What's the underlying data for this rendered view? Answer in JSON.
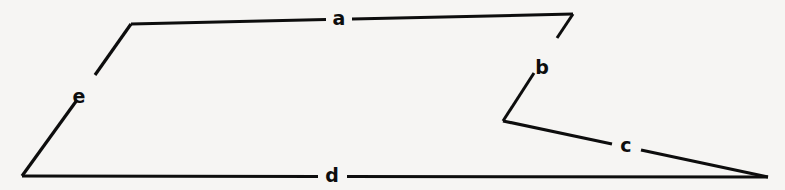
{
  "figure": {
    "kind": "labelled-polygon-line-drawing",
    "background_color": "#f6f5f3",
    "stroke_color": "#0d0d0d",
    "canvas": {
      "width": 785,
      "height": 190
    },
    "vertices": [
      {
        "name": "bottom-left",
        "x": 22,
        "y": 176
      },
      {
        "name": "upper-left",
        "x": 131,
        "y": 24
      },
      {
        "name": "upper-right",
        "x": 573,
        "y": 14
      },
      {
        "name": "reflex-notch",
        "x": 503,
        "y": 121
      },
      {
        "name": "right-point",
        "x": 768,
        "y": 177
      }
    ],
    "edges": [
      {
        "id": "edge-a",
        "label": "a",
        "from": {
          "x": 131,
          "y": 24
        },
        "to": {
          "x": 573,
          "y": 14
        },
        "gap_start": {
          "x": 326,
          "y": 19.6
        },
        "gap_end": {
          "x": 352,
          "y": 19.0
        },
        "label_pos": {
          "x": 339,
          "y": 18
        },
        "stroke_width": 3.0
      },
      {
        "id": "edge-b",
        "label": "b",
        "from": {
          "x": 573,
          "y": 14
        },
        "to": {
          "x": 503,
          "y": 121
        },
        "gap_start": {
          "x": 557,
          "y": 38
        },
        "gap_end": {
          "x": 534,
          "y": 73
        },
        "label_pos": {
          "x": 542,
          "y": 67
        },
        "stroke_width": 3.0
      },
      {
        "id": "edge-c",
        "label": "c",
        "from": {
          "x": 503,
          "y": 121
        },
        "to": {
          "x": 768,
          "y": 177
        },
        "gap_start": {
          "x": 612,
          "y": 144
        },
        "gap_end": {
          "x": 641,
          "y": 150
        },
        "label_pos": {
          "x": 626,
          "y": 145
        },
        "stroke_width": 3.2
      },
      {
        "id": "edge-d",
        "label": "d",
        "from": {
          "x": 768,
          "y": 177
        },
        "to": {
          "x": 22,
          "y": 176
        },
        "gap_start": {
          "x": 347,
          "y": 176.5
        },
        "gap_end": {
          "x": 318,
          "y": 176.5
        },
        "label_pos": {
          "x": 332,
          "y": 175
        },
        "stroke_width": 3.0
      },
      {
        "id": "edge-e",
        "label": "e",
        "from": {
          "x": 22,
          "y": 176
        },
        "to": {
          "x": 131,
          "y": 24
        },
        "gap_start": {
          "x": 77,
          "y": 100
        },
        "gap_end": {
          "x": 95,
          "y": 75
        },
        "label_pos": {
          "x": 79,
          "y": 96
        },
        "stroke_width": 3.2
      }
    ]
  }
}
